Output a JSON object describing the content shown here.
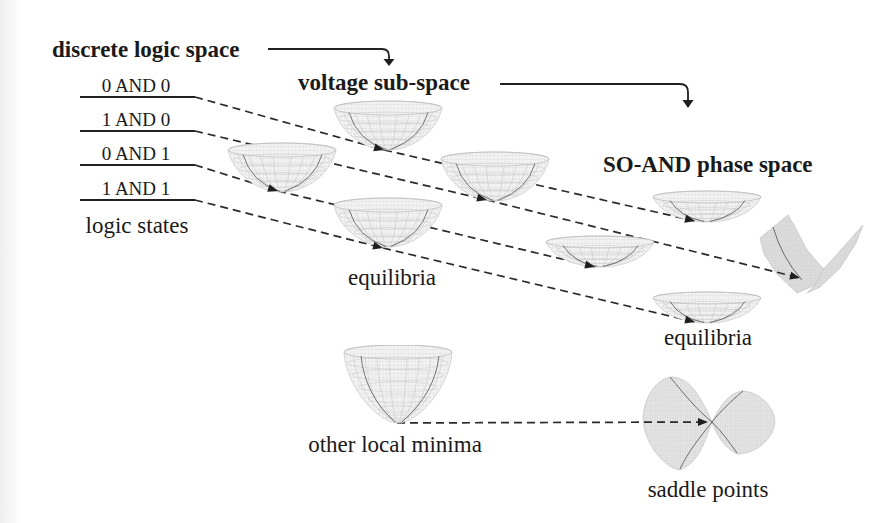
{
  "headers": {
    "discrete_logic_space": "discrete logic space",
    "voltage_sub_space": "voltage sub-space",
    "so_and_phase_space": "SO-AND phase space"
  },
  "logic_states": {
    "items": [
      "0 AND 0",
      "1 AND 0",
      "0 AND 1",
      "1 AND 1"
    ],
    "caption": "logic states"
  },
  "voltage_sub_space": {
    "caption": "equilibria",
    "local_minima_caption": "other local minima"
  },
  "phase_space": {
    "equilibria_caption": "equilibria",
    "saddle_caption": "saddle points"
  },
  "connections": [
    {
      "from": "0 AND 0",
      "via": "voltage-equilibrium-top",
      "to": "phase-equilibrium-top"
    },
    {
      "from": "1 AND 0",
      "via": "voltage-equilibrium-right",
      "to": "phase-tilted-surface"
    },
    {
      "from": "0 AND 1",
      "via": "voltage-equilibrium-left",
      "to": "phase-equilibrium-middle"
    },
    {
      "from": "1 AND 1",
      "via": "voltage-equilibrium-bottom",
      "to": "phase-equilibrium-bottom"
    },
    {
      "from": "other local minima",
      "to": "saddle points"
    }
  ],
  "colors": {
    "line": "#2a2a2a",
    "surface": "#dedede",
    "mesh": "#cbcbcb"
  }
}
